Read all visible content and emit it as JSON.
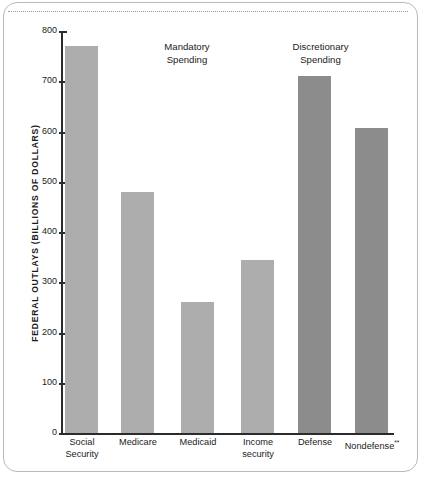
{
  "chart_data": {
    "type": "bar",
    "title": "",
    "subtitle": "",
    "xlabel": "",
    "ylabel": "FEDERAL OUTLAYS (BILLIONS OF DOLLARS)",
    "ylim": [
      0,
      800
    ],
    "ytick_step": 100,
    "yticks": [
      800,
      700,
      600,
      500,
      400,
      300,
      200,
      100,
      0
    ],
    "ytick_labels": [
      "800",
      "700",
      "600",
      "500",
      "400",
      "300",
      "200",
      "100",
      "0"
    ],
    "grid": false,
    "legend": "none",
    "categories": [
      "Social Security",
      "Medicare",
      "Medicaid",
      "Income security",
      "Defense",
      "Nondefense"
    ],
    "category_lines": [
      [
        "Social",
        "Security"
      ],
      [
        "Medicare"
      ],
      [
        "Medicaid"
      ],
      [
        "Income",
        "security"
      ],
      [
        "Defense"
      ],
      [
        "Nondefense"
      ]
    ],
    "values": [
      770,
      480,
      260,
      345,
      710,
      608
    ],
    "bars": [
      {
        "label": "Social Security",
        "value": 770,
        "group": "mandatory",
        "color": "#adadad",
        "footnote": ""
      },
      {
        "label": "Medicare",
        "value": 480,
        "group": "mandatory",
        "color": "#adadad",
        "footnote": ""
      },
      {
        "label": "Medicaid",
        "value": 260,
        "group": "mandatory",
        "color": "#adadad",
        "footnote": ""
      },
      {
        "label": "Income security",
        "value": 345,
        "group": "mandatory",
        "color": "#adadad",
        "footnote": ""
      },
      {
        "label": "Defense",
        "value": 710,
        "group": "discretionary",
        "color": "#8c8c8c",
        "footnote": ""
      },
      {
        "label": "Nondefense",
        "value": 608,
        "group": "discretionary",
        "color": "#8c8c8c",
        "footnote": "**"
      }
    ],
    "annotations": [
      {
        "name": "mandatory-spending",
        "lines": [
          "Mandatory",
          "Spending"
        ]
      },
      {
        "name": "discretionary-spending",
        "lines": [
          "Discretionary",
          "Spending"
        ]
      }
    ],
    "colors": {
      "mandatory_bar": "#adadad",
      "discretionary_bar": "#8c8c8c",
      "axis": "#2b2b2b",
      "text": "#1b1b1b",
      "frame_border": "#b9b9b9",
      "dotted_rule": "#9a9a9a",
      "background": "#ffffff"
    }
  },
  "annotations": {
    "mandatory_line1": "Mandatory",
    "mandatory_line2": "Spending",
    "discretionary_line1": "Discretionary",
    "discretionary_line2": "Spending"
  },
  "axis": {
    "y_title": "FEDERAL OUTLAYS (BILLIONS OF DOLLARS)",
    "tick_800": "800",
    "tick_700": "700",
    "tick_600": "600",
    "tick_500": "500",
    "tick_400": "400",
    "tick_300": "300",
    "tick_200": "200",
    "tick_100": "100",
    "tick_0": "0"
  },
  "categories": {
    "social_security_l1": "Social",
    "social_security_l2": "Security",
    "medicare_l1": "Medicare",
    "medicaid_l1": "Medicaid",
    "income_security_l1": "Income",
    "income_security_l2": "security",
    "defense_l1": "Defense",
    "nondefense_l1": "Nondefense",
    "nondefense_footnote": "**"
  }
}
